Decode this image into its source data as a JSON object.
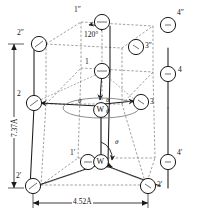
{
  "figure": {
    "kind": "crystal-structure-diagram",
    "colors": {
      "solid_line": "#1a1a1a",
      "dashed_line": "#6b6b6b",
      "atom_fill": "#ffffff",
      "atom_stroke": "#1a1a1a",
      "background": "#ffffff"
    }
  },
  "dimensions": {
    "height_label": "7.37Å",
    "width_label": "4.52Å"
  },
  "angles": {
    "hex_angle": "120°",
    "theta": "θ"
  },
  "atom_labels": {
    "top_1": "1″",
    "top_2": "2″",
    "top_3": "3″",
    "top_4": "4″",
    "mid_1": "1",
    "mid_2": "2",
    "mid_3": "3",
    "mid_4": "4",
    "bot_1": "1′",
    "bot_2": "2′",
    "bot_3": "3′",
    "bot_4": "4′",
    "center_atom": "W",
    "bottom_atom": "W"
  },
  "theta_labels": {
    "center_left": "θ",
    "center_upper_right": "θ",
    "center_lower_right": "θ",
    "bottom": "θ"
  }
}
